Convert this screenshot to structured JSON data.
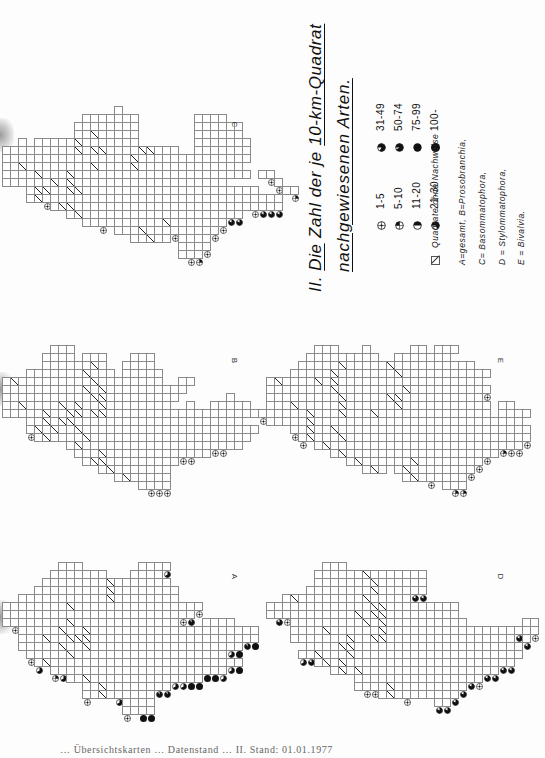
{
  "document": {
    "orientation": "rotated 90deg clockwise (page scanned sideways)",
    "title_number": "II.",
    "title_line1_parts": [
      "Die",
      "Zahl der je",
      "10-km-Quadrat"
    ],
    "title_line1": "II. Die Zahl der je 10-km-Quadrat",
    "title_line2": "nachgewiesenen Arten.",
    "caption": "… Übersichtskarten … Datenstand … II. Stand: 01.01.1977"
  },
  "legend": {
    "classes": [
      {
        "code": "1",
        "label": "1-5"
      },
      {
        "code": "2",
        "label": "5-10"
      },
      {
        "code": "3",
        "label": "11-20"
      },
      {
        "code": "4",
        "label": "21-30"
      },
      {
        "code": "5",
        "label": "31-49"
      },
      {
        "code": "6",
        "label": "50-74"
      },
      {
        "code": "7",
        "label": "75-99"
      },
      {
        "code": "8",
        "label": "100-"
      }
    ],
    "no_record_label": "Quadrate ohne Nachweise",
    "key_lines": [
      "A=gesamt,  B=Prosobranchia,",
      "C= Basommatophora,",
      "D = Stylommatophora,",
      "E = Bivalvia."
    ]
  },
  "maps": [
    {
      "id": "C",
      "label": "C",
      "x": 2,
      "y": 106,
      "label_x": 232,
      "label_y": 120,
      "rows": [
        "..............o......................",
        "..........ooo1ooo.......1111.........",
        ".........o1o1o1oo.......1o11oo.......",
        ".........o1/o555o.......1511oo.......",
        "..o.o1o1o/o5o111o.......15o1o1o......",
        "o11555o1o/o//o1oo//o11..oo1oooo......",
        "1111111111111o1o/o1555155o1111o......",
        "oo/o1oooo1o/o1oo/o115o1o1111oo.......",
        "oooo/ooo/o1o1111o1o11111111oooo.o1...",
        "oooooo/o/oo1111o1111115555oo......1..",
        "...o//oo//o11o1o1o1111515555o1oo...o2",
        "...o/1o11oo1oo15oo1o115555555o1o1o2..",
        "......o//ooo11oo1oo11o1o5555o1o1555..",
        "........o/o1o1o1oo1o1ooo1o1555.......",
        "..........oo1o1ooo1o/o11o1o1.........",
        "..............ooo/ooo11o1o1..........",
        "................oo/oo.o1o1...........",
        "......................oo11...........",
        "......................o12............"
      ]
    },
    {
      "id": "B",
      "label": "B",
      "x": 2,
      "y": 345,
      "label_x": 232,
      "label_y": 356,
      "rows": [
        "......ooo............................",
        ".....o11o.11o...o11..................",
        ".....o11oo1/o..o111..................",
        "...o11o11o/11o.o1o1o.................",
        "o/oo1oo1oo1/o11oo11o..oo.............",
        "11o11o1ooo/o/oo11o1o11o..............",
        "1111111oooo//11ooo11oo......o........",
        "oo/11oo/o/oo/111ooooo..1..ooooo......",
        "ooo1o/oo//o//oooooo1ooo1o1oooooo11o..",
        "...1o/o//o1oo11111o11o1oo111o1.......",
        "...1/o/o1/1o11111o111o111111111o.....",
        "....o/oo1o/o111o1o11111111111oo......",
        "........o/o11oo11ooo11111111oo.......",
        ".........ooo/ooo11oooo11oo...........",
        "..........o//o11oo.o1o...............",
        "............o/1oo.o1o................",
        "..............o/ooo11................",
        ".................o111................"
      ]
    },
    {
      "id": "A",
      "label": "A",
      "x": 2,
      "y": 562,
      "label_x": 232,
      "label_y": 572,
      "rows": [
        ".......542.......4454................",
        "......1442221...1667.................",
        ".....o7441332/1866661................",
        "....44o4o7763/48866742...............",
        "..o41458o6722/48866321...............",
        "1445884o/o444618866411111............",
        "47788824446o466886444116.............",
        "o17844o1/1o14788663444...7633........",
        "..5866o/1o/666688686688456622445.....",
        "..14o/1o///o2688888888866446o168.....",
        "..o1418/o1/4688888888688886o48.......",
        "...14o11/1o26844688888888848.........",
        "....4/1o4442o44688888888888848.......",
        "......2447441388888878888884.........",
        "........oo/o1486877784488............",
        "..........o4/o8446466................",
        "..........1o/o44884..................",
        "...............o188..................",
        "...............1o88.................."
      ]
    },
    {
      "id": "E",
      "label": "E",
      "x": 266,
      "y": 345,
      "label_x": 498,
      "label_y": 356,
      "rows": [
        "......ooo...1.....oo.ooo.............",
        ".....o1o.oo1oo..oooo11o..............",
        "....o11oo/ooo1o/o1111o1ooo...........",
        "...o111o/o31111o/11o111o1ooo.........",
        "o/oo1o/o/111111o1111o1111oo..........",
        "1111o1o1/11o1o11o/11111o1111.........",
        "111111111/oo1o1//111111111o..........",
        "ooo/1oooo/o1oo1o/11111111111.o2......",
        "...1o/ooo/oo1/1111111111511o.o11o....",
        "ooo1o/111o11o1o11111115551o1o11o.....",
        "...1o/1o/1o111111111111111o1o1o11....",
        "....1/11o/o1o1111o1111115511o1o11....",
        "......o/o11o11111o11111o11115211.....",
        "........o/o111oo1o1111111111o........",
        "..........o/11ooo1/1o1o1211..........",
        "............o/o.o/11o11o11...........",
        ".................o/o1oo11............",
        "......................o22............"
      ]
    },
    {
      "id": "D",
      "label": "D",
      "x": 266,
      "y": 562,
      "label_x": 498,
      "label_y": 572,
      "rows": [
        ".......55o...........................",
        "......1545o1/o1o5o55.................",
        "......o54o111/11oo55.................",
        ".....o5o5o551/1o5o55.................",
        "..o/o1oo55o1/1o155...................",
        "o5o1o5445515o//1o11o55oo.............",
        "o515555o5o1/o//oo1o55545.............",
        "...o55o11o11/o/oo1555555o.......55...",
        "...o15o/115111/o1o55155555555115o1...",
        "...ooo55oo/oo//oo1o155555555555.5....",
        ".....o11o//1o1o5o55555o55555555o.....",
        "....45/o1o/11115555551555555555o.....",
        "......o/o/4o55o1o1o1o1155555555......",
        "........o/o/oo5551o5o55555555........",
        "...........o5o55o5o55o55551..........",
        "...........o11o/o15555o55............",
        "..............o/o1ooo555.............",
        ".....................55.............."
      ]
    }
  ]
}
